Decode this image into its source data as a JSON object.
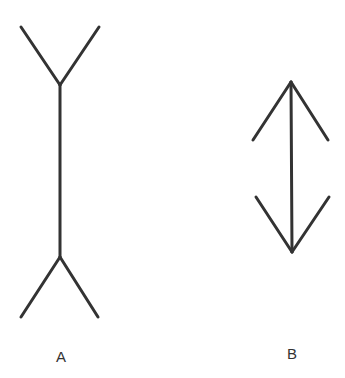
{
  "figure": {
    "line_color": "#333333",
    "figures": [
      {
        "label": "A",
        "shaft": {
          "x1": 60,
          "y1": 85,
          "x2": 60,
          "y2": 257
        },
        "fins": [
          [
            21,
            27,
            60,
            85
          ],
          [
            99,
            27,
            60,
            85
          ],
          [
            60,
            257,
            21,
            317
          ],
          [
            60,
            257,
            98,
            317
          ]
        ]
      },
      {
        "label": "B",
        "shaft": {
          "x1": 291,
          "y1": 82,
          "x2": 292,
          "y2": 252
        },
        "fins": [
          [
            291,
            82,
            253,
            140
          ],
          [
            291,
            82,
            328,
            140
          ],
          [
            256,
            197,
            292,
            252
          ],
          [
            329,
            197,
            292,
            252
          ]
        ]
      }
    ]
  },
  "labels": {
    "a": "A",
    "b": "B"
  }
}
